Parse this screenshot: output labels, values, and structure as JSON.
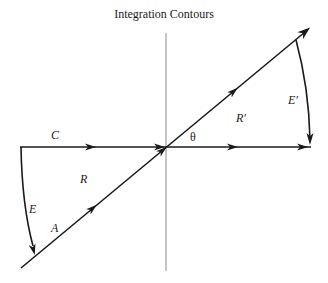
{
  "title": "Integration Contours",
  "labels": {
    "C": "C",
    "R": "R",
    "E": "E",
    "A": "A",
    "theta": "θ",
    "R_prime": "R′",
    "E_prime": "E′"
  },
  "colors": {
    "stroke": "#1a1a1a",
    "axis": "#888888",
    "background": "#ffffff"
  }
}
